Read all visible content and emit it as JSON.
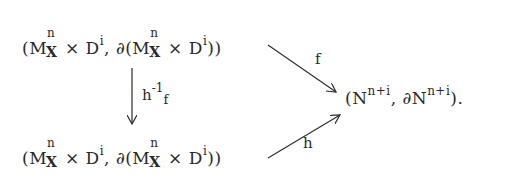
{
  "diagram": {
    "source_top": {
      "open": "(M",
      "sup1": "n",
      "sub1": "X",
      "times": " × D",
      "sup2": "i",
      "comma": ", ∂(M",
      "sup3": "n",
      "sub3": "X",
      "times2": " × D",
      "sup4": "i",
      "close": "))"
    },
    "source_bottom": {
      "open": "(M",
      "sup1": "n",
      "sub1": "X",
      "times": " × D",
      "sup2": "i",
      "comma": ", ∂(M",
      "sup3": "n",
      "sub3": "X",
      "times2": " × D",
      "sup4": "i",
      "close": "))"
    },
    "vertical_arrow_label": {
      "base": "h",
      "sup": "-1",
      "sub": "f"
    },
    "top_arrow_label": "f",
    "bottom_arrow_label": "h",
    "target": {
      "open": "(N",
      "sup1": "n+i",
      "mid": ", ∂N",
      "sup2": "n+i",
      "close": ")."
    },
    "colors": {
      "ink": "#2a2a2a",
      "background": "#ffffff"
    }
  }
}
